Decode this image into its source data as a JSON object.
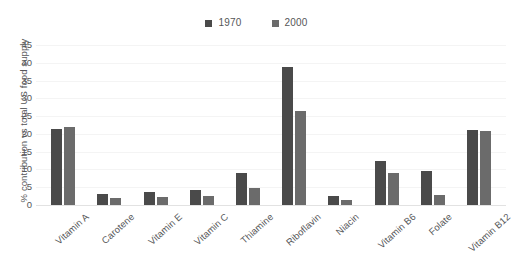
{
  "chart_data": {
    "type": "bar",
    "title": "",
    "subtitle": "",
    "xlabel": "",
    "ylabel": "% contribution vs total US food supply",
    "ylim": [
      0,
      45
    ],
    "ytick_labels": [
      "0",
      "5",
      "10",
      "15",
      "20",
      "25",
      "30",
      "35",
      "40",
      "45"
    ],
    "ytick_values": [
      0,
      5,
      10,
      15,
      20,
      25,
      30,
      35,
      40,
      45
    ],
    "grid": true,
    "grid_axis": "y",
    "legend_position": "top-center",
    "orientation": "vertical",
    "categories": [
      "Vitamin A",
      "Carotene",
      "Vitamin E",
      "Vitamin C",
      "Thiamine",
      "Riboflavin",
      "Niacin",
      "Vitamin B6",
      "Folate",
      "Vitamin B12"
    ],
    "series": [
      {
        "name": "1970",
        "color": "#4a4a4a",
        "values": [
          21.5,
          3.0,
          3.8,
          4.2,
          9.0,
          38.7,
          2.4,
          12.3,
          9.5,
          21.0
        ]
      },
      {
        "name": "2000",
        "color": "#6b6b6b",
        "values": [
          22.0,
          2.0,
          2.2,
          2.4,
          4.8,
          26.5,
          1.4,
          8.9,
          2.8,
          20.8
        ]
      }
    ]
  },
  "legend": {
    "items": [
      {
        "label": "1970",
        "color": "#4a4a4a"
      },
      {
        "label": "2000",
        "color": "#6b6b6b"
      }
    ]
  },
  "axis": {
    "y_title": "% contribution vs total US food supply"
  },
  "colors": {
    "series_1970": "#4a4a4a",
    "series_2000": "#6b6b6b",
    "text": "#555658",
    "gridline": "#f4f4f4",
    "baseline": "#e2e2e2",
    "background": "#ffffff"
  }
}
